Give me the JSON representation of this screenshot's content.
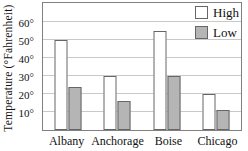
{
  "chart_data": {
    "type": "bar",
    "title": "",
    "xlabel": "",
    "ylabel": "Temperature (°Fahrenheit)",
    "categories": [
      "Albany",
      "Anchorage",
      "Boise",
      "Chicago"
    ],
    "series": [
      {
        "name": "High",
        "values": [
          50,
          30,
          55,
          20
        ],
        "fill": "#ffffff"
      },
      {
        "name": "Low",
        "values": [
          24,
          16,
          30,
          11
        ],
        "fill": "#b5b5b5"
      }
    ],
    "yticks": [
      10,
      20,
      30,
      40,
      50,
      60
    ],
    "ytick_labels": [
      "10°",
      "20°",
      "30°",
      "40°",
      "50°",
      "60°"
    ],
    "ylim": [
      0,
      71.5
    ],
    "grid": true,
    "legend_position": "top-right",
    "colors": {
      "bar_border": "#666666",
      "gridline": "#c9c9c9",
      "plot_border": "#808080",
      "text": "#111111"
    }
  }
}
